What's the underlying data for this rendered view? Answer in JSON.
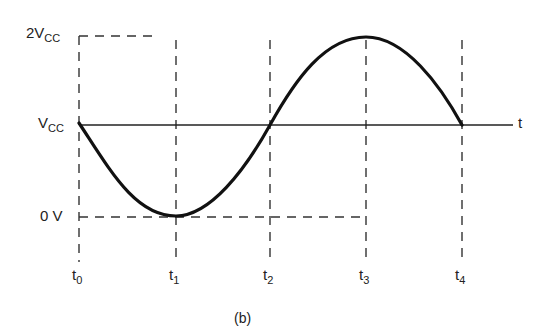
{
  "diagram": {
    "caption": "(b)",
    "axis_label_t": "t",
    "y_labels": {
      "two_vcc": {
        "main": "2V",
        "sub": "CC"
      },
      "vcc": {
        "main": "V",
        "sub": "CC"
      },
      "zero": {
        "main": "0 V",
        "sub": ""
      }
    },
    "x_labels": [
      {
        "main": "t",
        "sub": "0"
      },
      {
        "main": "t",
        "sub": "1"
      },
      {
        "main": "t",
        "sub": "2"
      },
      {
        "main": "t",
        "sub": "3"
      },
      {
        "main": "t",
        "sub": "4"
      }
    ],
    "waveform": "Sine wave centered on Vcc, starting at Vcc at t0, minimum 0 V at t1, back to Vcc at t2, maximum 2Vcc at t3, back to Vcc at t4",
    "colors": {
      "curve": "#111111",
      "dashes": "#333333",
      "axis": "#222222"
    }
  }
}
